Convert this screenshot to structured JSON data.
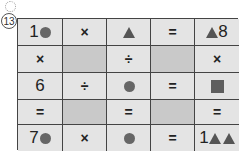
{
  "problem_number": "13",
  "grid": {
    "rows": [
      [
        {
          "number": "1",
          "shape": "circle"
        },
        {
          "op": "×"
        },
        {
          "shape": "triangle"
        },
        {
          "op": "="
        },
        {
          "shape": "triangle",
          "number_after": "8"
        }
      ],
      [
        {
          "op": "×"
        },
        {
          "blank": true
        },
        {
          "op": "÷"
        },
        {
          "blank": true
        },
        {
          "op": "×"
        }
      ],
      [
        {
          "number": "6"
        },
        {
          "op": "÷"
        },
        {
          "shape": "circle"
        },
        {
          "op": "="
        },
        {
          "shape": "square"
        }
      ],
      [
        {
          "op": "="
        },
        {
          "blank": true
        },
        {
          "op": "="
        },
        {
          "blank": true
        },
        {
          "op": "="
        }
      ],
      [
        {
          "number": "7",
          "shape": "circle"
        },
        {
          "op": "×"
        },
        {
          "shape": "circle"
        },
        {
          "op": "="
        },
        {
          "number": "1",
          "shape": "triangle",
          "shape2": "triangle"
        }
      ]
    ]
  },
  "colors": {
    "cell_bg": "#e4e4e4",
    "blank_cell_bg": "#c9c9c9",
    "shape_fill": "#5e5e5e",
    "grid_line": "#444444"
  }
}
